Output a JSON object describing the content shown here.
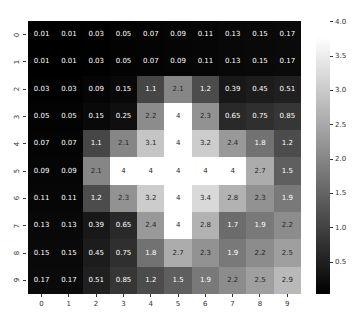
{
  "chart_data": {
    "type": "heatmap",
    "title": "",
    "xlabel": "",
    "ylabel": "",
    "x_tick_labels": [
      "0",
      "1",
      "2",
      "3",
      "4",
      "5",
      "6",
      "7",
      "8",
      "9"
    ],
    "y_tick_labels": [
      "0",
      "1",
      "2",
      "3",
      "4",
      "5",
      "6",
      "7",
      "8",
      "9"
    ],
    "colormap": "gray",
    "color_range": [
      0.01,
      4.0
    ],
    "annotated": true,
    "colorbar": {
      "ticks": [
        "0.5",
        "1.0",
        "1.5",
        "2.0",
        "2.5",
        "3.0",
        "3.5",
        "4.0"
      ],
      "tick_values": [
        0.5,
        1.0,
        1.5,
        2.0,
        2.5,
        3.0,
        3.5,
        4.0
      ]
    },
    "values": [
      [
        0.01,
        0.01,
        0.03,
        0.05,
        0.07,
        0.09,
        0.11,
        0.13,
        0.15,
        0.17
      ],
      [
        0.01,
        0.01,
        0.03,
        0.05,
        0.07,
        0.09,
        0.11,
        0.13,
        0.15,
        0.17
      ],
      [
        0.03,
        0.03,
        0.09,
        0.15,
        1.1,
        2.1,
        1.2,
        0.39,
        0.45,
        0.51
      ],
      [
        0.05,
        0.05,
        0.15,
        0.25,
        2.2,
        4,
        2.3,
        0.65,
        0.75,
        0.85
      ],
      [
        0.07,
        0.07,
        1.1,
        2.1,
        3.1,
        4,
        3.2,
        2.4,
        1.8,
        1.2
      ],
      [
        0.09,
        0.09,
        2.1,
        4,
        4,
        4,
        4,
        4,
        2.7,
        1.5
      ],
      [
        0.11,
        0.11,
        1.2,
        2.3,
        3.2,
        4,
        3.4,
        2.8,
        2.3,
        1.9
      ],
      [
        0.13,
        0.13,
        0.39,
        0.65,
        2.4,
        4,
        2.8,
        1.7,
        1.9,
        2.2
      ],
      [
        0.15,
        0.15,
        0.45,
        0.75,
        1.8,
        2.7,
        2.3,
        1.9,
        2.2,
        2.5
      ],
      [
        0.17,
        0.17,
        0.51,
        0.85,
        1.2,
        1.5,
        1.9,
        2.2,
        2.5,
        2.9
      ]
    ],
    "value_labels": [
      [
        "0.01",
        "0.01",
        "0.03",
        "0.05",
        "0.07",
        "0.09",
        "0.11",
        "0.13",
        "0.15",
        "0.17"
      ],
      [
        "0.01",
        "0.01",
        "0.03",
        "0.05",
        "0.07",
        "0.09",
        "0.11",
        "0.13",
        "0.15",
        "0.17"
      ],
      [
        "0.03",
        "0.03",
        "0.09",
        "0.15",
        "1.1",
        "2.1",
        "1.2",
        "0.39",
        "0.45",
        "0.51"
      ],
      [
        "0.05",
        "0.05",
        "0.15",
        "0.25",
        "2.2",
        "4",
        "2.3",
        "0.65",
        "0.75",
        "0.85"
      ],
      [
        "0.07",
        "0.07",
        "1.1",
        "2.1",
        "3.1",
        "4",
        "3.2",
        "2.4",
        "1.8",
        "1.2"
      ],
      [
        "0.09",
        "0.09",
        "2.1",
        "4",
        "4",
        "4",
        "4",
        "4",
        "2.7",
        "1.5"
      ],
      [
        "0.11",
        "0.11",
        "1.2",
        "2.3",
        "3.2",
        "4",
        "3.4",
        "2.8",
        "2.3",
        "1.9"
      ],
      [
        "0.13",
        "0.13",
        "0.39",
        "0.65",
        "2.4",
        "4",
        "2.8",
        "1.7",
        "1.9",
        "2.2"
      ],
      [
        "0.15",
        "0.15",
        "0.45",
        "0.75",
        "1.8",
        "2.7",
        "2.3",
        "1.9",
        "2.2",
        "2.5"
      ],
      [
        "0.17",
        "0.17",
        "0.51",
        "0.85",
        "1.2",
        "1.5",
        "1.9",
        "2.2",
        "2.5",
        "2.9"
      ]
    ]
  }
}
